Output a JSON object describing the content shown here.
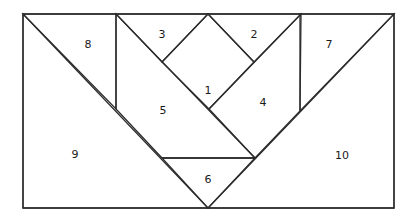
{
  "diagram": {
    "type": "tangram-style dissection of a rectangle",
    "stroke_color": "#2b2b2b",
    "background": "#ffffff",
    "pieces": [
      {
        "id": "1",
        "label": "1",
        "shape": "square (diamond)",
        "points": [
          [
            208,
            14
          ],
          [
            254,
            62
          ],
          [
            209,
            109
          ],
          [
            162,
            62
          ]
        ],
        "label_pos": [
          208,
          90
        ]
      },
      {
        "id": "2",
        "label": "2",
        "shape": "triangle",
        "points": [
          [
            208,
            14
          ],
          [
            301,
            14
          ],
          [
            254,
            62
          ]
        ],
        "label_pos": [
          254,
          34
        ]
      },
      {
        "id": "3",
        "label": "3",
        "shape": "triangle",
        "points": [
          [
            116,
            14
          ],
          [
            208,
            14
          ],
          [
            162,
            62
          ]
        ],
        "label_pos": [
          162,
          34
        ]
      },
      {
        "id": "4",
        "label": "4",
        "shape": "parallelogram",
        "points": [
          [
            209,
            109
          ],
          [
            301,
            14
          ],
          [
            300,
            111
          ],
          [
            255,
            158
          ]
        ],
        "label_pos": [
          263,
          102
        ]
      },
      {
        "id": "5",
        "label": "5",
        "shape": "parallelogram",
        "points": [
          [
            116,
            14
          ],
          [
            255,
            158
          ],
          [
            162,
            158
          ],
          [
            116,
            109
          ]
        ],
        "label_pos": [
          163,
          110
        ]
      },
      {
        "id": "6",
        "label": "6",
        "shape": "triangle",
        "points": [
          [
            162,
            158
          ],
          [
            255,
            158
          ],
          [
            208,
            208
          ]
        ],
        "label_pos": [
          208,
          179
        ]
      },
      {
        "id": "7",
        "label": "7",
        "shape": "triangle",
        "points": [
          [
            300,
            14
          ],
          [
            394,
            14
          ],
          [
            300,
            111
          ]
        ],
        "label_pos": [
          329,
          44
        ]
      },
      {
        "id": "8",
        "label": "8",
        "shape": "triangle",
        "points": [
          [
            23,
            14
          ],
          [
            116,
            14
          ],
          [
            116,
            109
          ]
        ],
        "label_pos": [
          88,
          44
        ]
      },
      {
        "id": "9",
        "label": "9",
        "shape": "triangle",
        "points": [
          [
            23,
            14
          ],
          [
            208,
            208
          ],
          [
            23,
            208
          ]
        ],
        "label_pos": [
          75,
          154
        ]
      },
      {
        "id": "10",
        "label": "10",
        "shape": "triangle",
        "points": [
          [
            394,
            14
          ],
          [
            394,
            208
          ],
          [
            208,
            208
          ]
        ],
        "label_pos": [
          342,
          155
        ]
      }
    ]
  }
}
